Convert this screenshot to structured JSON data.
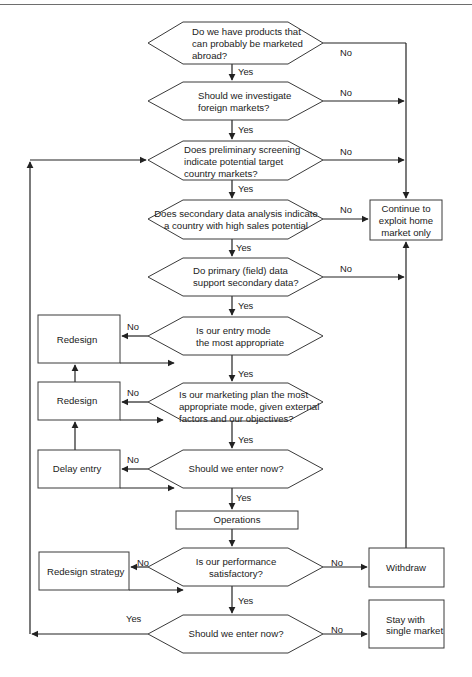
{
  "diagram": {
    "type": "flowchart",
    "decisions": [
      {
        "id": "d1",
        "lines": [
          "Do we have products that",
          "can probably be marketed",
          "abroad?"
        ],
        "align": "left"
      },
      {
        "id": "d2",
        "lines": [
          "Should we investigate",
          "foreign markets?"
        ],
        "align": "left"
      },
      {
        "id": "d3",
        "lines": [
          "Does preliminary screening",
          "indicate potential target",
          "country markets?"
        ],
        "align": "left"
      },
      {
        "id": "d4",
        "lines": [
          "Does secondary data analysis indicate",
          "a country with high sales potential"
        ],
        "align": "center"
      },
      {
        "id": "d5",
        "lines": [
          "Do primary (field) data",
          "support secondary data?"
        ],
        "align": "left"
      },
      {
        "id": "d6",
        "lines": [
          "Is our entry mode",
          "the most appropriate"
        ],
        "align": "left"
      },
      {
        "id": "d7",
        "lines": [
          "Is our marketing plan the most",
          "appropriate mode, given external",
          "factors and our objectives?"
        ],
        "align": "left"
      },
      {
        "id": "d8",
        "lines": [
          "Should we enter now?"
        ],
        "align": "center"
      },
      {
        "id": "d9",
        "lines": [
          "Is our performance",
          "satisfactory?"
        ],
        "align": "center"
      },
      {
        "id": "d10",
        "lines": [
          "Should we enter now?"
        ],
        "align": "center"
      }
    ],
    "processes": [
      {
        "id": "continue",
        "lines": [
          "Continue to",
          "exploit home",
          "market only"
        ]
      },
      {
        "id": "redesign1",
        "lines": [
          "Redesign"
        ]
      },
      {
        "id": "redesign2",
        "lines": [
          "Redesign"
        ]
      },
      {
        "id": "delay",
        "lines": [
          "Delay entry"
        ]
      },
      {
        "id": "operations",
        "lines": [
          "Operations"
        ]
      },
      {
        "id": "redesign_strategy",
        "lines": [
          "Redesign strategy"
        ]
      },
      {
        "id": "withdraw",
        "lines": [
          "Withdraw"
        ]
      },
      {
        "id": "stay",
        "lines": [
          "Stay with",
          "single market"
        ]
      }
    ],
    "edge_labels": {
      "yes": "Yes",
      "no": "No"
    },
    "edges": [
      {
        "from": "d1",
        "to": "d2",
        "label": "Yes"
      },
      {
        "from": "d1",
        "to": "continue",
        "label": "No"
      },
      {
        "from": "d2",
        "to": "d3",
        "label": "Yes"
      },
      {
        "from": "d2",
        "to": "continue",
        "label": "No"
      },
      {
        "from": "d3",
        "to": "d4",
        "label": "Yes"
      },
      {
        "from": "d3",
        "to": "continue",
        "label": "No"
      },
      {
        "from": "d4",
        "to": "d5",
        "label": "Yes"
      },
      {
        "from": "d4",
        "to": "continue",
        "label": "No"
      },
      {
        "from": "d5",
        "to": "d6",
        "label": "Yes"
      },
      {
        "from": "d5",
        "to": "continue",
        "label": "No"
      },
      {
        "from": "d6",
        "to": "d7",
        "label": "Yes"
      },
      {
        "from": "d6",
        "to": "redesign1",
        "label": "No"
      },
      {
        "from": "redesign1",
        "to": "d6",
        "label": ""
      },
      {
        "from": "d7",
        "to": "d8",
        "label": "Yes"
      },
      {
        "from": "d7",
        "to": "redesign2",
        "label": "No"
      },
      {
        "from": "redesign2",
        "to": "d7",
        "label": ""
      },
      {
        "from": "redesign2",
        "to": "redesign1",
        "label": ""
      },
      {
        "from": "d8",
        "to": "operations",
        "label": "Yes"
      },
      {
        "from": "d8",
        "to": "delay",
        "label": "No"
      },
      {
        "from": "delay",
        "to": "d8",
        "label": ""
      },
      {
        "from": "delay",
        "to": "redesign2",
        "label": ""
      },
      {
        "from": "operations",
        "to": "d9",
        "label": ""
      },
      {
        "from": "d9",
        "to": "d10",
        "label": "Yes"
      },
      {
        "from": "d9",
        "to": "redesign_strategy",
        "label": "No"
      },
      {
        "from": "redesign_strategy",
        "to": "d9",
        "label": ""
      },
      {
        "from": "d9",
        "to": "withdraw",
        "label": "No"
      },
      {
        "from": "withdraw",
        "to": "continue",
        "label": ""
      },
      {
        "from": "d10",
        "to": "stay",
        "label": "No"
      },
      {
        "from": "d10",
        "to": "d3",
        "label": "Yes"
      }
    ]
  }
}
